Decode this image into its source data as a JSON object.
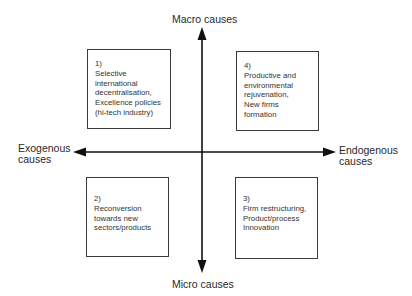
{
  "diagram": {
    "type": "quadrant",
    "axes": {
      "vertical": {
        "top_label": "Macro causes",
        "bottom_label": "Micro causes"
      },
      "horizontal": {
        "left_label": [
          "Exogenous",
          "causes"
        ],
        "right_label": [
          "Endogenous",
          "causes"
        ]
      }
    },
    "quadrants": [
      {
        "position": "top-left",
        "number": "1)",
        "lines": [
          "Selective",
          "international",
          "decentralisation,",
          "Excellence policies",
          "(hi-tech industry)"
        ]
      },
      {
        "position": "top-right",
        "number": "4)",
        "lines": [
          "Productive and",
          "environmental",
          "rejuvenation,",
          "New firms",
          "formation"
        ]
      },
      {
        "position": "bottom-left",
        "number": "2)",
        "lines": [
          "Reconversion",
          "towards new",
          "sectors/products"
        ]
      },
      {
        "position": "bottom-right",
        "number": "3)",
        "lines": [
          "Firm restructuring,",
          "Product/process",
          "Innovation"
        ]
      }
    ],
    "colors": {
      "line": "#111111",
      "box_border": "#3a3a3a",
      "text": "#2a2a2a"
    }
  }
}
